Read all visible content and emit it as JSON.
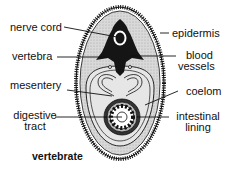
{
  "diagram": {
    "title": "vertebrate",
    "labels_left": [
      {
        "id": "nerve-cord",
        "text": "nerve cord"
      },
      {
        "id": "vertebra",
        "text": "vertebra"
      },
      {
        "id": "mesentery",
        "text": "mesentery"
      },
      {
        "id": "digestive-tract",
        "line1": "digestive",
        "line2": "tract"
      }
    ],
    "labels_right": [
      {
        "id": "epidermis",
        "text": "epidermis"
      },
      {
        "id": "blood-vessels",
        "line1": "blood",
        "line2": "vessels"
      },
      {
        "id": "coelom",
        "text": "coelom"
      },
      {
        "id": "intestinal-lining",
        "line1": "intestinal",
        "line2": "lining"
      }
    ],
    "colors": {
      "outline": "#111111",
      "body_fill": "#d6d6d6",
      "coelom_fill": "#e8e8e8",
      "dark": "#151515"
    }
  }
}
